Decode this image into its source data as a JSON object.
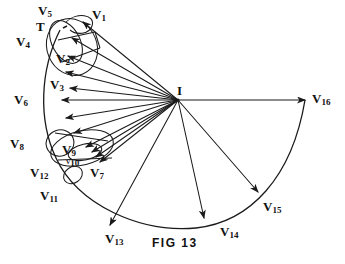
{
  "figure": {
    "caption": "FIG 13",
    "apex_label": "I",
    "tangent_label": "T",
    "stroke_color": "#1a1a1a",
    "background": "#ffffff",
    "labels": [
      {
        "id": "v1",
        "text": "V",
        "sub": "1",
        "x": 92,
        "y": 8
      },
      {
        "id": "v2",
        "text": "V",
        "sub": "2",
        "x": 56,
        "y": 52
      },
      {
        "id": "v3",
        "text": "V",
        "sub": "3",
        "x": 50,
        "y": 78
      },
      {
        "id": "v4",
        "text": "V",
        "sub": "4",
        "x": 16,
        "y": 35
      },
      {
        "id": "v5",
        "text": "V",
        "sub": "5",
        "x": 38,
        "y": 4
      },
      {
        "id": "v6",
        "text": "V",
        "sub": "6",
        "x": 14,
        "y": 93
      },
      {
        "id": "v7",
        "text": "V",
        "sub": "7",
        "x": 90,
        "y": 166
      },
      {
        "id": "v8",
        "text": "V",
        "sub": "8",
        "x": 10,
        "y": 137
      },
      {
        "id": "v9",
        "text": "V",
        "sub": "9",
        "x": 62,
        "y": 143
      },
      {
        "id": "v10",
        "text": "V",
        "sub": "10",
        "x": 66,
        "y": 157
      },
      {
        "id": "v11",
        "text": "V",
        "sub": "11",
        "x": 40,
        "y": 189
      },
      {
        "id": "v12",
        "text": "V",
        "sub": "12",
        "x": 30,
        "y": 166
      },
      {
        "id": "v13",
        "text": "V",
        "sub": "13",
        "x": 105,
        "y": 232
      },
      {
        "id": "v14",
        "text": "V",
        "sub": "14",
        "x": 220,
        "y": 225
      },
      {
        "id": "v15",
        "text": "V",
        "sub": "15",
        "x": 263,
        "y": 200
      },
      {
        "id": "v16",
        "text": "V",
        "sub": "16",
        "x": 312,
        "y": 92
      }
    ]
  }
}
